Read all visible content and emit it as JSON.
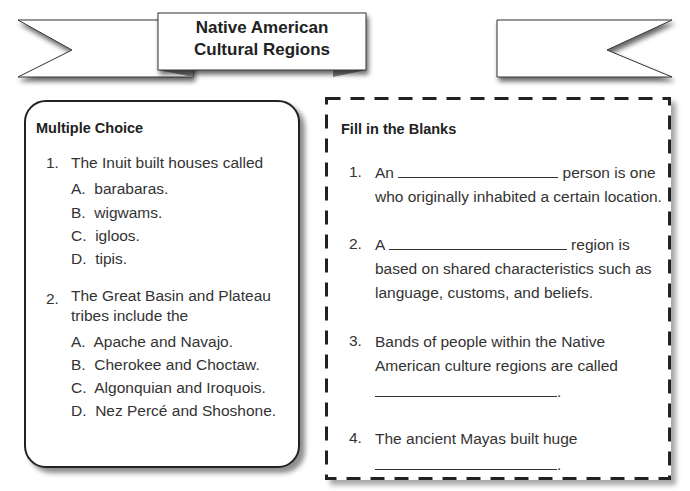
{
  "banner": {
    "title_line1": "Native American",
    "title_line2": "Cultural Regions"
  },
  "multiple_choice": {
    "heading": "Multiple Choice",
    "questions": [
      {
        "number": "1.",
        "text": "The Inuit built houses called",
        "options": [
          {
            "letter": "A.",
            "text": "barabaras."
          },
          {
            "letter": "B.",
            "text": "wigwams."
          },
          {
            "letter": "C.",
            "text": "igloos."
          },
          {
            "letter": "D.",
            "text": "tipis."
          }
        ]
      },
      {
        "number": "2.",
        "text_line1": "The Great Basin and Plateau",
        "text_line2": "tribes include the",
        "options": [
          {
            "letter": "A.",
            "text": "Apache and Navajo."
          },
          {
            "letter": "B.",
            "text": "Cherokee and Choctaw."
          },
          {
            "letter": "C.",
            "text": "Algonquian and Iroquois."
          },
          {
            "letter": "D.",
            "text": "Nez Percé and Shoshone."
          }
        ]
      }
    ]
  },
  "fill_blanks": {
    "heading": "Fill in the Blanks",
    "questions": [
      {
        "number": "1.",
        "before": "An",
        "after": "person is one",
        "line2": "who originally inhabited a certain location."
      },
      {
        "number": "2.",
        "before": "A",
        "after": "region is",
        "line2": "based on shared characteristics such as",
        "line3": "language, customs, and beliefs."
      },
      {
        "number": "3.",
        "line1": "Bands of people within the Native",
        "line2": "American culture regions are called",
        "end": "."
      },
      {
        "number": "4.",
        "line1": "The ancient Mayas built huge",
        "end": "."
      }
    ]
  }
}
